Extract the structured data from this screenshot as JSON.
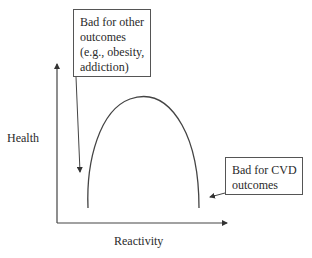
{
  "diagram": {
    "type": "inverted-U curve",
    "y_axis": {
      "label": "Health"
    },
    "x_axis": {
      "label": "Reactivity"
    },
    "annotations": [
      {
        "id": "low-reactivity",
        "lines": [
          "Bad for other",
          "outcomes",
          "(e.g., obesity,",
          "addiction)"
        ],
        "points_to": "left tail of curve (low reactivity)"
      },
      {
        "id": "high-reactivity",
        "lines": [
          "Bad for CVD",
          "outcomes"
        ],
        "points_to": "right tail of curve (high reactivity)"
      }
    ],
    "colors": {
      "stroke": "#444444",
      "text": "#2a2a2a",
      "background": "#ffffff"
    }
  }
}
